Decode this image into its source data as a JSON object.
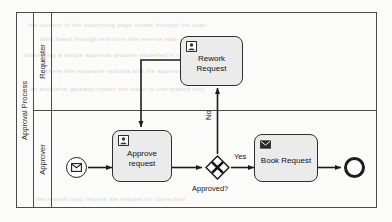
{
  "diagram": {
    "type": "bpmn-process-diagram",
    "pool": {
      "name": "Approval Process"
    },
    "lanes": [
      {
        "id": "requester",
        "name": "Requester"
      },
      {
        "id": "approver",
        "name": "Approver"
      }
    ],
    "nodes": [
      {
        "id": "start-event",
        "type": "message-start-event",
        "label": "",
        "icon": "envelope-icon",
        "lane": "approver"
      },
      {
        "id": "approve-request",
        "type": "user-task",
        "label": "Approve request",
        "icon": "user-icon",
        "lane": "approver"
      },
      {
        "id": "approved-gateway",
        "type": "exclusive-gateway",
        "label": "Approved?",
        "icon": "x-icon",
        "lane": "approver"
      },
      {
        "id": "book-request",
        "type": "send-task",
        "label": "Book Request",
        "icon": "envelope-icon",
        "lane": "approver"
      },
      {
        "id": "end-event",
        "type": "end-event",
        "label": "",
        "icon": "",
        "lane": "approver"
      },
      {
        "id": "rework-request",
        "type": "user-task",
        "label": "Rework\nRequest",
        "icon": "user-icon",
        "lane": "requester"
      }
    ],
    "task_labels": {
      "approve_request_line1": "Approve",
      "approve_request_line2": "request",
      "rework_request_line1": "Rework",
      "rework_request_line2": "Request",
      "book_request": "Book Request"
    },
    "flow_labels": {
      "yes": "Yes",
      "no": "No",
      "gateway": "Approved?"
    },
    "flows": [
      {
        "from": "start-event",
        "to": "approve-request",
        "label": ""
      },
      {
        "from": "approve-request",
        "to": "approved-gateway",
        "label": ""
      },
      {
        "from": "approved-gateway",
        "to": "book-request",
        "label": "Yes"
      },
      {
        "from": "approved-gateway",
        "to": "rework-request",
        "label": "No"
      },
      {
        "from": "rework-request",
        "to": "approve-request",
        "label": ""
      },
      {
        "from": "book-request",
        "to": "end-event",
        "label": ""
      }
    ],
    "colors": {
      "task_fill": "#ebebeb",
      "stroke": "#2f2f2f",
      "background": "#fbfbfa",
      "text": "#111111"
    }
  },
  "background_text": {
    "lines": [
      "the content of the underlying page shows through the scan",
      "faint bleed through text from the reverse side of the sheet",
      "illustrating a simple approval process modelled in notation",
      "where the requester submits and the approver decides",
      "an exclusive gateway routes the token to one branch only",
      "the rework loop returns the request for correction"
    ]
  }
}
